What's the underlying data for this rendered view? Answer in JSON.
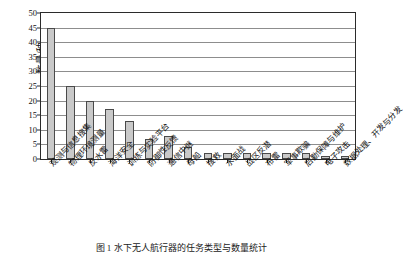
{
  "chart_data": {
    "type": "bar",
    "title": "",
    "xlabel": "",
    "ylabel": "数量/种",
    "ylim": [
      0,
      50
    ],
    "yticks": [
      0,
      5,
      10,
      15,
      20,
      25,
      30,
      35,
      40,
      45,
      50
    ],
    "grid": true,
    "legend": false,
    "categories": [
      "观测与信息搜集",
      "物理环境测量",
      "反水雷",
      "海洋安全",
      "训练与实验平台",
      "防御性反馈",
      "通信中继",
      "母船",
      "搜救",
      "水面战",
      "战区反潜",
      "布雷",
      "军事欺骗",
      "后勤保障与维护",
      "电子攻击",
      "数据处理、开发与分发"
    ],
    "values": [
      45,
      25,
      20,
      17,
      13,
      7,
      8,
      4,
      2,
      2,
      2,
      2,
      2,
      2,
      1,
      1
    ],
    "bar_fill": "#c9c9c9",
    "bar_stroke": "#4a4a4a",
    "grid_color": "#8d8d8d",
    "axis_color": "#2b2b2b"
  },
  "caption": {
    "text": "图 1  水下无人航行器的任务类型与数量统计"
  }
}
